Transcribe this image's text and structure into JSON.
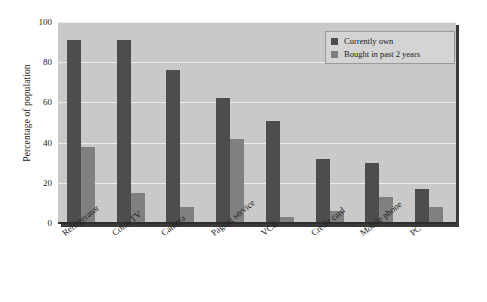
{
  "chart_data": {
    "type": "bar",
    "title": "",
    "xlabel": "",
    "ylabel": "Percentage of population",
    "ylim": [
      0,
      100
    ],
    "yticks": [
      0,
      20,
      40,
      60,
      80,
      100
    ],
    "ytick_labels": [
      "0",
      "20",
      "40",
      "60",
      "80",
      "100"
    ],
    "grid": true,
    "legend_position": "top-right",
    "categories": [
      "Refrigerator",
      "Color TV",
      "Camera",
      "Paging service",
      "VCR",
      "Credit card",
      "Mobile phone",
      "PC"
    ],
    "series": [
      {
        "name": "Currently own",
        "color": "#4d4d4d",
        "values": [
          91,
          91,
          76,
          62,
          51,
          32,
          30,
          17
        ]
      },
      {
        "name": "Bought in past 2 years",
        "color": "#808080",
        "values": [
          38,
          15,
          8,
          42,
          3,
          6,
          13,
          8
        ]
      }
    ]
  },
  "style": {
    "plot_background": "#c9c9c9",
    "page_background": "#ffffff",
    "gridline_color": "#ececed",
    "axis_color": "#2e2e2e"
  }
}
